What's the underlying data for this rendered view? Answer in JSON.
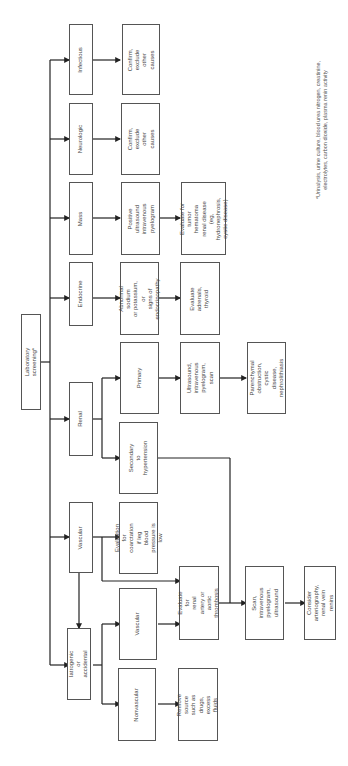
{
  "diagram": {
    "root": "Laboratory screening*",
    "level1": {
      "infectious": "Infectious",
      "neurologic": "Neurologic",
      "mass": "Mass",
      "endocrine": "Endocrine",
      "renal": "Renal",
      "vascular": "Vascular",
      "iatrogenic": "Iatrogenic or\naccidental"
    },
    "infectious": {
      "action": "Confirm, exclude\nother causes"
    },
    "neurologic": {
      "action": "Confirm, exclude\nother causes"
    },
    "mass": {
      "step1": "Positive ultrasound\nintravenous\npyelogram",
      "step2": "Evaluate for\ntumor hematoma\nrenal disease (eg,\nhydronephrosis,\ncystic disease)"
    },
    "endocrine": {
      "step1": "Abnormal sodium\nor potassium, or\nsigns of\nendocrinopathy",
      "step2": "Evaluate adrenals,\nthyroid"
    },
    "renal": {
      "primary": "Primary",
      "primary_test": "Ultrasound,\nintravenous\npyelogram, scan",
      "primary_result": "Parenchymal\nobstruction,\ncystic disease,\nnephrolithiasis",
      "secondary": "Secondary to\nhypertension"
    },
    "vascular": {
      "coarctation": "Evaluation for\ncoarctation if leg\nblood pressure is\nlow",
      "renal_artery": "Evaluate for\nrenal artery or\naortic thrombosis",
      "scan": "Scan,\nintravenous\npyelogram,\nultrasound",
      "arteriography": "Consider\narteriography,\nrenal vein renins"
    },
    "iatrogenic": {
      "vascular": "Vascular",
      "nonvascular": "Nonvascular",
      "remove": "Remove source\nsuch as drugs,\nexcess fluids"
    },
    "footnote": "*Urinalysis, urine culture, blood urea nitrogen, creatinine,\nelectrolytes, carbon dioxide, plasma renin activity"
  }
}
